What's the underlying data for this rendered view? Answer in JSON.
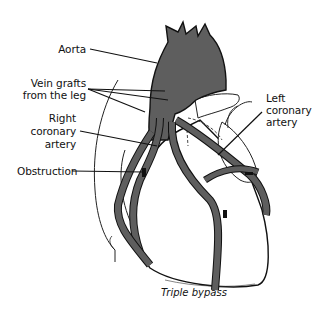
{
  "diagram": {
    "caption": "Triple bypass",
    "colors": {
      "vessel_fill": "#5e5e5e",
      "outline": "#111111",
      "background": "#ffffff"
    },
    "labels": {
      "aorta": "Aorta",
      "vein_grafts_line1": "Vein grafts",
      "vein_grafts_line2": "from the leg",
      "right_coronary_line1": "Right",
      "right_coronary_line2": "coronary",
      "right_coronary_line3": "artery",
      "obstruction": "Obstruction",
      "left_coronary_line1": "Left",
      "left_coronary_line2": "coronary",
      "left_coronary_line3": "artery"
    }
  }
}
